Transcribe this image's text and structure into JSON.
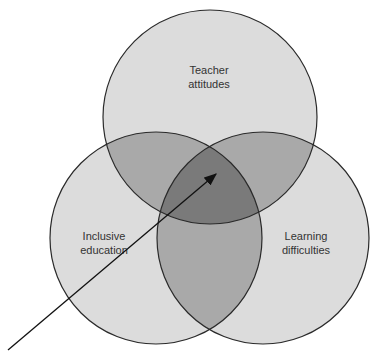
{
  "diagram": {
    "type": "venn",
    "sets": [
      {
        "id": "teacher",
        "label_lines": [
          "Teacher",
          "attitudes"
        ],
        "cx": 210,
        "cy": 117,
        "r": 107
      },
      {
        "id": "inclusive",
        "label_lines": [
          "Inclusive",
          "education"
        ],
        "cx": 156,
        "cy": 238,
        "r": 106
      },
      {
        "id": "learning",
        "label_lines": [
          "Learning",
          "difficulties"
        ],
        "cx": 263,
        "cy": 238,
        "r": 106
      }
    ],
    "arrow": {
      "from": [
        8,
        350
      ],
      "to": [
        218,
        173
      ],
      "target": "center intersection"
    },
    "colors": {
      "single": "#dcdcdc",
      "pair": "#a9a9a9",
      "triple": "#7a7a7a",
      "stroke": "#2a2a2a"
    }
  }
}
